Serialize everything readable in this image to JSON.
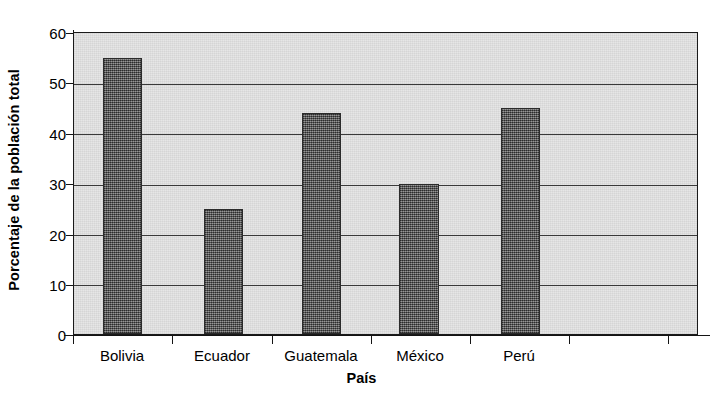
{
  "chart_data": {
    "type": "bar",
    "title": "",
    "subtitle": "",
    "xlabel": "País",
    "ylabel": "Porcentaje de la población total",
    "categories": [
      "Bolivia",
      "Ecuador",
      "Guatemala",
      "México",
      "Perú"
    ],
    "values": [
      55,
      25,
      44,
      30,
      45
    ],
    "series": [
      {
        "name": "Porcentaje de la población total",
        "values": [
          55,
          25,
          44,
          30,
          45
        ]
      }
    ],
    "ylim": [
      0,
      60
    ],
    "ytick_labels": [
      "0",
      "10",
      "20",
      "30",
      "40",
      "50",
      "60"
    ],
    "ytick_values": [
      0,
      10,
      20,
      30,
      40,
      50,
      60
    ],
    "grid": "horizontal",
    "legend": "none",
    "colors": {
      "bar_fill": "#585858",
      "bar_edge": "#2b2b2b",
      "plot_background": "#e4e4e4",
      "axis": "#141414",
      "gridline": "#3a3a3a",
      "text": "#000000",
      "figure_background": "#ffffff"
    }
  }
}
